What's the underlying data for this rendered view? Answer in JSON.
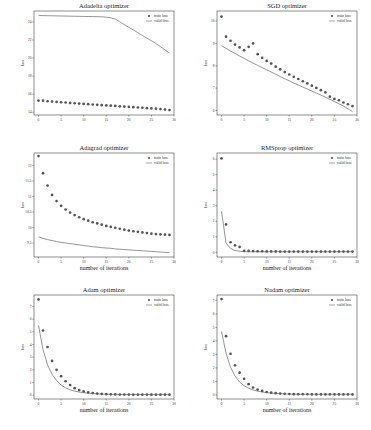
{
  "figure": {
    "width": 371,
    "height": 430
  },
  "colors": {
    "train": "#555555",
    "valid": "#666666",
    "axis": "#444444",
    "text": "#222222"
  },
  "chart_data": [
    {
      "type": "line",
      "id": "adadelta",
      "title": "Adadelta optimizer",
      "xlabel": "",
      "ylabel": "loss",
      "xticks": [
        0,
        5,
        10,
        15,
        20,
        25,
        30
      ],
      "yticks": [
        14,
        16,
        18,
        20,
        22,
        24
      ],
      "xlim": [
        -1,
        30
      ],
      "ylim": [
        13.7,
        25.2
      ],
      "legend": {
        "position": "upper right",
        "entries": [
          "train loss",
          "valid loss"
        ]
      },
      "x": [
        0,
        1,
        2,
        3,
        4,
        5,
        6,
        7,
        8,
        9,
        10,
        11,
        12,
        13,
        14,
        15,
        16,
        17,
        18,
        19,
        20,
        21,
        22,
        23,
        24,
        25,
        26,
        27,
        28,
        29
      ],
      "series": [
        {
          "name": "train loss",
          "style": "markers",
          "values": [
            15.3,
            15.28,
            15.22,
            15.19,
            15.15,
            15.11,
            15.08,
            15.04,
            15.0,
            14.96,
            14.93,
            14.9,
            14.86,
            14.82,
            14.79,
            14.76,
            14.73,
            14.7,
            14.66,
            14.63,
            14.6,
            14.56,
            14.53,
            14.5,
            14.46,
            14.43,
            14.4,
            14.36,
            14.3,
            14.25
          ]
        },
        {
          "name": "valid loss",
          "style": "line",
          "values": [
            24.7,
            24.69,
            24.68,
            24.67,
            24.66,
            24.65,
            24.64,
            24.63,
            24.62,
            24.61,
            24.6,
            24.59,
            24.58,
            24.57,
            24.56,
            24.52,
            24.45,
            24.3,
            24.0,
            23.7,
            23.4,
            23.1,
            22.8,
            22.5,
            22.2,
            21.9,
            21.6,
            21.25,
            20.9,
            20.55
          ]
        }
      ]
    },
    {
      "type": "line",
      "id": "sgd",
      "title": "SGD optimizer",
      "xlabel": "",
      "ylabel": "loss",
      "xticks": [
        0,
        5,
        10,
        15,
        20,
        25,
        30
      ],
      "yticks": [
        6,
        7,
        8,
        9,
        10
      ],
      "xlim": [
        -1,
        30
      ],
      "ylim": [
        5.8,
        10.45
      ],
      "legend": {
        "position": "upper right",
        "entries": [
          "train loss",
          "valid loss"
        ]
      },
      "x": [
        0,
        1,
        2,
        3,
        4,
        5,
        6,
        7,
        8,
        9,
        10,
        11,
        12,
        13,
        14,
        15,
        16,
        17,
        18,
        19,
        20,
        21,
        22,
        23,
        24,
        25,
        26,
        27,
        28,
        29
      ],
      "series": [
        {
          "name": "train loss",
          "style": "markers",
          "values": [
            10.2,
            9.3,
            9.12,
            8.95,
            8.82,
            8.7,
            8.85,
            9.0,
            8.52,
            8.36,
            8.22,
            8.1,
            7.96,
            7.84,
            7.72,
            7.61,
            7.51,
            7.41,
            7.31,
            7.21,
            7.11,
            7.01,
            6.91,
            6.81,
            6.62,
            6.52,
            6.46,
            6.36,
            6.28,
            6.2
          ]
        },
        {
          "name": "valid loss",
          "style": "line",
          "values": [
            8.9,
            8.78,
            8.66,
            8.55,
            8.44,
            8.33,
            8.22,
            8.12,
            8.02,
            7.92,
            7.82,
            7.72,
            7.62,
            7.52,
            7.42,
            7.33,
            7.23,
            7.14,
            7.05,
            6.96,
            6.87,
            6.78,
            6.69,
            6.6,
            6.5,
            6.4,
            6.3,
            6.2,
            6.08,
            5.95
          ]
        }
      ]
    },
    {
      "type": "line",
      "id": "adagrad",
      "title": "Adagrad optimizer",
      "xlabel": "number of iterations",
      "ylabel": "loss",
      "xticks": [
        0,
        5,
        10,
        15,
        20,
        25,
        30
      ],
      "yticks": [
        9.5,
        10,
        10.5,
        11,
        11.5,
        12
      ],
      "xlim": [
        -1,
        30
      ],
      "ylim": [
        9.05,
        12.4
      ],
      "legend": {
        "position": "upper right",
        "entries": [
          "train loss",
          "valid loss"
        ]
      },
      "x": [
        0,
        1,
        2,
        3,
        4,
        5,
        6,
        7,
        8,
        9,
        10,
        11,
        12,
        13,
        14,
        15,
        16,
        17,
        18,
        19,
        20,
        21,
        22,
        23,
        24,
        25,
        26,
        27,
        28,
        29
      ],
      "series": [
        {
          "name": "train loss",
          "style": "markers",
          "values": [
            12.3,
            11.75,
            11.35,
            11.05,
            10.85,
            10.7,
            10.58,
            10.48,
            10.4,
            10.33,
            10.27,
            10.22,
            10.17,
            10.13,
            10.09,
            10.05,
            10.02,
            9.99,
            9.96,
            9.93,
            9.9,
            9.88,
            9.86,
            9.84,
            9.82,
            9.8,
            9.79,
            9.78,
            9.77,
            9.76
          ]
        },
        {
          "name": "valid loss",
          "style": "line",
          "values": [
            9.7,
            9.65,
            9.61,
            9.58,
            9.55,
            9.52,
            9.5,
            9.48,
            9.46,
            9.44,
            9.42,
            9.4,
            9.38,
            9.37,
            9.35,
            9.34,
            9.33,
            9.31,
            9.3,
            9.29,
            9.28,
            9.27,
            9.26,
            9.25,
            9.24,
            9.23,
            9.22,
            9.21,
            9.2,
            9.19
          ]
        }
      ]
    },
    {
      "type": "line",
      "id": "rmsprop",
      "title": "RMSprop optimizer",
      "xlabel": "number of iterations",
      "ylabel": "loss",
      "xticks": [
        0,
        5,
        10,
        15,
        20,
        25,
        30
      ],
      "yticks": [
        0,
        1,
        2,
        3,
        4,
        5,
        6
      ],
      "xlim": [
        -1,
        30
      ],
      "ylim": [
        -0.3,
        6.4
      ],
      "legend": {
        "position": "upper right",
        "entries": [
          "train loss",
          "valid loss"
        ]
      },
      "x": [
        0,
        1,
        2,
        3,
        4,
        5,
        6,
        7,
        8,
        9,
        10,
        11,
        12,
        13,
        14,
        15,
        16,
        17,
        18,
        19,
        20,
        21,
        22,
        23,
        24,
        25,
        26,
        27,
        28,
        29
      ],
      "series": [
        {
          "name": "train loss",
          "style": "markers",
          "values": [
            6.05,
            1.8,
            0.65,
            0.45,
            0.35,
            0.1,
            0.09,
            0.08,
            0.07,
            0.07,
            0.06,
            0.06,
            0.06,
            0.05,
            0.05,
            0.05,
            0.05,
            0.05,
            0.05,
            0.05,
            0.05,
            0.05,
            0.05,
            0.05,
            0.05,
            0.05,
            0.05,
            0.05,
            0.05,
            0.05
          ]
        },
        {
          "name": "valid loss",
          "style": "line",
          "values": [
            2.65,
            0.6,
            0.25,
            0.12,
            0.07,
            0.05,
            0.04,
            0.04,
            0.04,
            0.04,
            0.04,
            0.04,
            0.04,
            0.04,
            0.04,
            0.04,
            0.04,
            0.04,
            0.04,
            0.04,
            0.04,
            0.04,
            0.04,
            0.04,
            0.04,
            0.04,
            0.04,
            0.04,
            0.04,
            0.04
          ]
        }
      ]
    },
    {
      "type": "line",
      "id": "adam",
      "title": "Adam optimizer",
      "xlabel": "number of iterations",
      "ylabel": "loss",
      "xticks": [
        0,
        5,
        10,
        15,
        20,
        25,
        30
      ],
      "yticks": [
        0,
        1,
        2,
        3,
        4,
        5,
        6,
        7
      ],
      "xlim": [
        -1,
        30
      ],
      "ylim": [
        -0.3,
        7.9
      ],
      "legend": {
        "position": "upper right",
        "entries": [
          "train loss",
          "valid loss"
        ]
      },
      "x": [
        0,
        1,
        2,
        3,
        4,
        5,
        6,
        7,
        8,
        9,
        10,
        11,
        12,
        13,
        14,
        15,
        16,
        17,
        18,
        19,
        20,
        21,
        22,
        23,
        24,
        25,
        26,
        27,
        28,
        29
      ],
      "series": [
        {
          "name": "train loss",
          "style": "markers",
          "values": [
            7.55,
            5.1,
            3.8,
            2.7,
            2.0,
            1.5,
            1.1,
            0.8,
            0.55,
            0.4,
            0.3,
            0.22,
            0.17,
            0.13,
            0.1,
            0.08,
            0.07,
            0.06,
            0.05,
            0.05,
            0.05,
            0.04,
            0.04,
            0.04,
            0.04,
            0.04,
            0.04,
            0.04,
            0.04,
            0.04
          ]
        },
        {
          "name": "valid loss",
          "style": "line",
          "values": [
            5.5,
            3.6,
            2.4,
            1.65,
            1.15,
            0.8,
            0.58,
            0.42,
            0.32,
            0.25,
            0.2,
            0.16,
            0.13,
            0.11,
            0.09,
            0.08,
            0.07,
            0.06,
            0.06,
            0.05,
            0.05,
            0.05,
            0.05,
            0.05,
            0.05,
            0.05,
            0.05,
            0.05,
            0.05,
            0.05
          ]
        }
      ]
    },
    {
      "type": "line",
      "id": "nadam",
      "title": "Nadam optimizer",
      "xlabel": "number of iterations",
      "ylabel": "loss",
      "xticks": [
        0,
        5,
        10,
        15,
        20,
        25,
        30
      ],
      "yticks": [
        0,
        1,
        2,
        3,
        4,
        5,
        6,
        7
      ],
      "xlim": [
        -1,
        30
      ],
      "ylim": [
        -0.3,
        7.4
      ],
      "legend": {
        "position": "upper right",
        "entries": [
          "train loss",
          "valid loss"
        ]
      },
      "x": [
        0,
        1,
        2,
        3,
        4,
        5,
        6,
        7,
        8,
        9,
        10,
        11,
        12,
        13,
        14,
        15,
        16,
        17,
        18,
        19,
        20,
        21,
        22,
        23,
        24,
        25,
        26,
        27,
        28,
        29
      ],
      "series": [
        {
          "name": "train loss",
          "style": "markers",
          "values": [
            7.1,
            4.35,
            3.05,
            2.2,
            1.65,
            1.2,
            0.8,
            0.55,
            0.4,
            0.3,
            0.22,
            0.17,
            0.13,
            0.1,
            0.08,
            0.07,
            0.06,
            0.05,
            0.05,
            0.05,
            0.04,
            0.04,
            0.04,
            0.04,
            0.04,
            0.04,
            0.04,
            0.04,
            0.04,
            0.04
          ]
        },
        {
          "name": "valid loss",
          "style": "line",
          "values": [
            4.7,
            3.1,
            2.05,
            1.4,
            0.95,
            0.68,
            0.5,
            0.37,
            0.28,
            0.22,
            0.17,
            0.14,
            0.12,
            0.1,
            0.08,
            0.07,
            0.06,
            0.06,
            0.05,
            0.05,
            0.05,
            0.05,
            0.05,
            0.05,
            0.05,
            0.05,
            0.05,
            0.05,
            0.05,
            0.05
          ]
        }
      ]
    }
  ],
  "panels": [
    {
      "left": 20,
      "top": 0
    },
    {
      "left": 203,
      "top": 0
    },
    {
      "left": 20,
      "top": 142
    },
    {
      "left": 203,
      "top": 142
    },
    {
      "left": 20,
      "top": 284
    },
    {
      "left": 203,
      "top": 284
    }
  ]
}
